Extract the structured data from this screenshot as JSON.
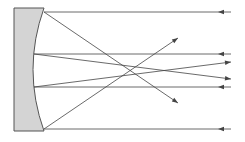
{
  "diagram": {
    "type": "concave-mirror-ray-diagram",
    "colors": {
      "background": "#ffffff",
      "mirror_fill": "#d4d4d4",
      "mirror_stroke": "#555555",
      "ray": "#444444"
    },
    "mirror": {
      "left_x": 14,
      "top_y": 8,
      "bottom_y": 131,
      "right_top_x": 44,
      "right_bottom_x": 44,
      "curve_mid_x": 33
    },
    "rays": [
      {
        "id": "incoming-top",
        "points": [
          [
            231,
            12
          ],
          [
            44,
            12
          ]
        ],
        "arrow": {
          "at": [
            218,
            12
          ],
          "dir": "left"
        }
      },
      {
        "id": "incoming-upper-mid",
        "points": [
          [
            231,
            54
          ],
          [
            34,
            54
          ]
        ],
        "arrow": {
          "at": [
            218,
            54
          ],
          "dir": "left"
        }
      },
      {
        "id": "incoming-lower-mid",
        "points": [
          [
            231,
            87
          ],
          [
            34,
            87
          ]
        ],
        "arrow": {
          "at": [
            218,
            87
          ],
          "dir": "left"
        }
      },
      {
        "id": "incoming-bottom",
        "points": [
          [
            231,
            129
          ],
          [
            44,
            129
          ]
        ],
        "arrow": {
          "at": [
            218,
            129
          ],
          "dir": "left"
        }
      },
      {
        "id": "reflected-top",
        "points": [
          [
            44,
            12
          ],
          [
            178,
            103
          ]
        ],
        "arrow": {
          "at": [
            178,
            103
          ],
          "dir": "down-right"
        }
      },
      {
        "id": "reflected-bottom",
        "points": [
          [
            44,
            129
          ],
          [
            178,
            38
          ]
        ],
        "arrow": {
          "at": [
            178,
            38
          ],
          "dir": "up-right"
        }
      },
      {
        "id": "reflected-upper-mid",
        "points": [
          [
            34,
            54
          ],
          [
            231,
            79
          ]
        ],
        "arrow": {
          "at": [
            231,
            79
          ],
          "dir": "right"
        }
      },
      {
        "id": "reflected-lower-mid",
        "points": [
          [
            34,
            87
          ],
          [
            231,
            62
          ]
        ],
        "arrow": {
          "at": [
            231,
            62
          ],
          "dir": "right"
        }
      }
    ]
  }
}
